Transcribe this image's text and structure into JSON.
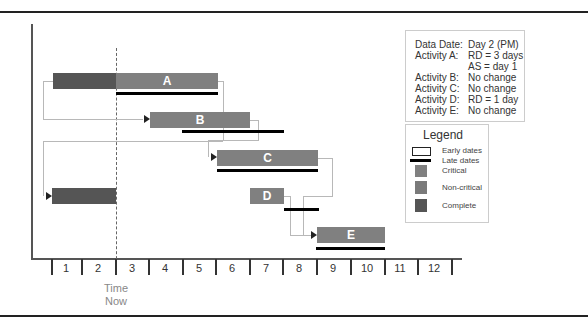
{
  "figure": {
    "time_now_label_1": "Time",
    "time_now_label_2": "Now",
    "data_date_box": [
      {
        "key": "Data Date:",
        "value": "Day 2 (PM)"
      },
      {
        "key": "Activity A:",
        "value": "RD = 3 days"
      },
      {
        "key": "",
        "value": "AS = day 1"
      },
      {
        "key": "Activity B:",
        "value": "No change"
      },
      {
        "key": "Activity C:",
        "value": "No change"
      },
      {
        "key": "Activity D:",
        "value": "RD = 1 day"
      },
      {
        "key": "Activity E:",
        "value": "No change"
      }
    ],
    "legend": {
      "title": "Legend",
      "items": [
        {
          "label": "Early dates",
          "swatch": "outline-box"
        },
        {
          "label": "Late dates",
          "swatch": "thick-line"
        },
        {
          "label": "Critical",
          "swatch": "#808080"
        },
        {
          "label": "Non-critical",
          "swatch": "#7a7a7a"
        },
        {
          "label": "Complete",
          "swatch": "#555555"
        }
      ]
    },
    "activities": [
      {
        "name": "A",
        "complete_days": [
          1,
          2
        ],
        "early_days": [
          3,
          5
        ],
        "late_days": [
          3,
          5
        ]
      },
      {
        "name": "B",
        "complete_days": null,
        "early_days": [
          4,
          6
        ],
        "late_days": [
          5,
          7
        ]
      },
      {
        "name": "C",
        "complete_days": null,
        "early_days": [
          6,
          8
        ],
        "late_days": [
          6,
          8
        ]
      },
      {
        "name": "",
        "complete_days": [
          1,
          2
        ],
        "early_days": null,
        "late_days": null
      },
      {
        "name": "D",
        "complete_days": null,
        "early_days": [
          7,
          7
        ],
        "late_days": [
          8,
          8
        ]
      },
      {
        "name": "E",
        "complete_days": null,
        "early_days": [
          9,
          10
        ],
        "late_days": [
          9,
          10
        ]
      }
    ],
    "axis": {
      "days": [
        "1",
        "2",
        "3",
        "4",
        "5",
        "6",
        "7",
        "8",
        "9",
        "10",
        "11",
        "12"
      ]
    },
    "colors": {
      "critical": "#808080",
      "complete": "#555555",
      "late": "#000000",
      "connector": "#b8b8b8"
    }
  }
}
